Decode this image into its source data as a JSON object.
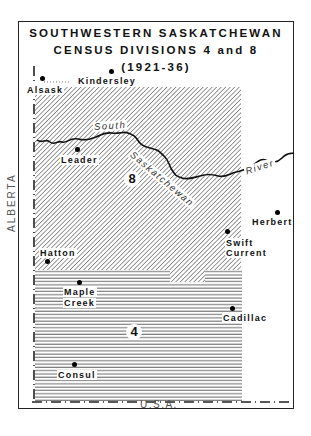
{
  "title": {
    "line1": "SOUTHWESTERN SASKATCHEWAN",
    "line2": "CENSUS DIVISIONS 4 and 8",
    "line3": "(1921-36)"
  },
  "divisions": [
    {
      "number": "8",
      "pattern": "diagonal-hatch"
    },
    {
      "number": "4",
      "pattern": "horizontal-hatch"
    }
  ],
  "places": [
    {
      "name": "Alsask"
    },
    {
      "name": "Kindersley"
    },
    {
      "name": "Leader"
    },
    {
      "name": "Herbert"
    },
    {
      "name": "Swift"
    },
    {
      "name": "Current"
    },
    {
      "name": "Hatton"
    },
    {
      "name": "Maple"
    },
    {
      "name": "Creek"
    },
    {
      "name": "Cadillac"
    },
    {
      "name": "Consul"
    }
  ],
  "river": {
    "word1": "South",
    "word2": "Saskatchewan",
    "word3": "River"
  },
  "borders": {
    "west": "ALBERTA",
    "south": "U.S.A."
  }
}
